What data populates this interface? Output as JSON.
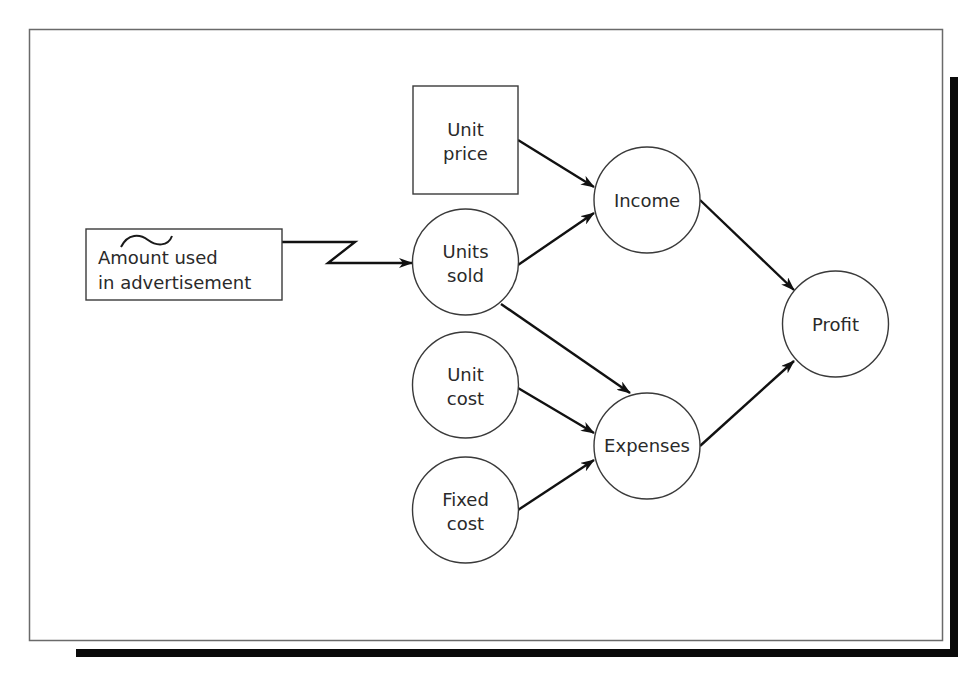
{
  "diagram": {
    "type": "influence-diagram",
    "colors": {
      "background": "#ffffff",
      "frame": "#6a6a6a",
      "shadow": "#0a0a0a",
      "node_stroke": "#3a3a3a",
      "arrow": "#111111",
      "text": "#2a2a2a"
    },
    "nodes": [
      {
        "id": "advertisement",
        "shape": "rectangle",
        "role": "decision",
        "lines": [
          "Amount used",
          "in advertisement"
        ],
        "has_tilde": true
      },
      {
        "id": "unit_price",
        "shape": "rectangle",
        "role": "decision",
        "lines": [
          "Unit",
          "price"
        ]
      },
      {
        "id": "units_sold",
        "shape": "circle",
        "role": "chance",
        "lines": [
          "Units",
          "sold"
        ]
      },
      {
        "id": "unit_cost",
        "shape": "circle",
        "role": "chance",
        "lines": [
          "Unit",
          "cost"
        ]
      },
      {
        "id": "fixed_cost",
        "shape": "circle",
        "role": "chance",
        "lines": [
          "Fixed",
          "cost"
        ]
      },
      {
        "id": "income",
        "shape": "circle",
        "role": "intermediate",
        "lines": [
          "Income"
        ]
      },
      {
        "id": "expenses",
        "shape": "circle",
        "role": "intermediate",
        "lines": [
          "Expenses"
        ]
      },
      {
        "id": "profit",
        "shape": "circle",
        "role": "outcome",
        "lines": [
          "Profit"
        ]
      }
    ],
    "edges": [
      {
        "from": "advertisement",
        "to": "units_sold",
        "style": "lightning"
      },
      {
        "from": "unit_price",
        "to": "income",
        "style": "straight"
      },
      {
        "from": "units_sold",
        "to": "income",
        "style": "straight"
      },
      {
        "from": "units_sold",
        "to": "expenses",
        "style": "straight"
      },
      {
        "from": "unit_cost",
        "to": "expenses",
        "style": "straight"
      },
      {
        "from": "fixed_cost",
        "to": "expenses",
        "style": "straight"
      },
      {
        "from": "income",
        "to": "profit",
        "style": "straight"
      },
      {
        "from": "expenses",
        "to": "profit",
        "style": "straight"
      }
    ]
  }
}
